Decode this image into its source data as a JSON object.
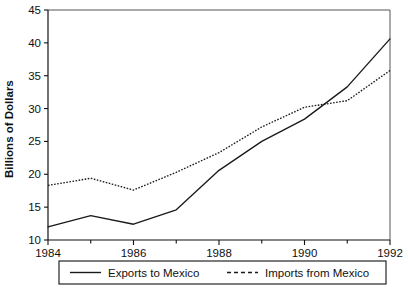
{
  "chart_data": {
    "type": "line",
    "title": "",
    "xlabel": "",
    "ylabel": "Billions of Dollars",
    "x": [
      1984,
      1985,
      1986,
      1987,
      1988,
      1989,
      1990,
      1991,
      1992
    ],
    "xlim": [
      1984,
      1992
    ],
    "ylim": [
      10,
      45
    ],
    "ytick_labels": [
      "10",
      "15",
      "20",
      "25",
      "30",
      "35",
      "40",
      "45"
    ],
    "ytick_values": [
      10,
      15,
      20,
      25,
      30,
      35,
      40,
      45
    ],
    "xtick_labels": [
      "1984",
      "1986",
      "1988",
      "1990",
      "1992"
    ],
    "xtick_values": [
      1984,
      1986,
      1988,
      1990,
      1992
    ],
    "xminor_tick_values": [
      1985,
      1987,
      1989,
      1991
    ],
    "grid": false,
    "legend_position": "below-axes",
    "series": [
      {
        "name": "Exports to Mexico",
        "style": "solid",
        "values": [
          12.0,
          13.7,
          12.4,
          14.6,
          20.6,
          25.0,
          28.4,
          33.3,
          40.6
        ]
      },
      {
        "name": "Imports from Mexico",
        "style": "dotted",
        "values": [
          18.3,
          19.4,
          17.6,
          20.3,
          23.3,
          27.2,
          30.2,
          31.2,
          35.8
        ]
      }
    ]
  },
  "legend": {
    "entries": [
      {
        "label": "Exports to Mexico",
        "style": "solid"
      },
      {
        "label": "Imports from Mexico",
        "style": "dashed"
      }
    ]
  },
  "caption": {
    "text": ""
  },
  "colors": {
    "line": "#1a1a1a",
    "axis": "#111111",
    "frame": "#555555",
    "background": "#ffffff"
  }
}
